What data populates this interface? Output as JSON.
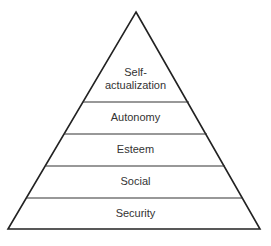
{
  "diagram": {
    "type": "pyramid",
    "levels": [
      {
        "label_line1": "Self-",
        "label_line2": "actualization"
      },
      {
        "label": "Autonomy"
      },
      {
        "label": "Esteem"
      },
      {
        "label": "Social"
      },
      {
        "label": "Security"
      }
    ]
  }
}
